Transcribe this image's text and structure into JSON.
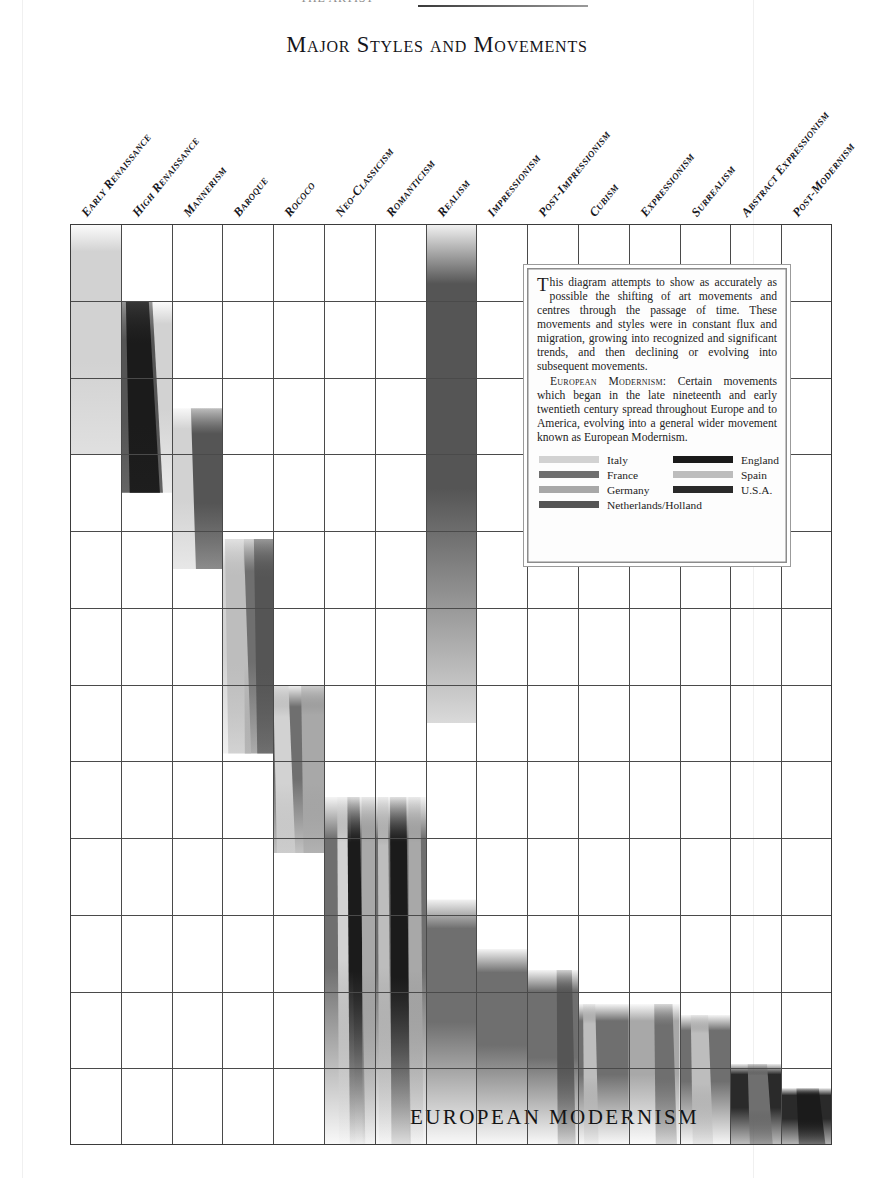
{
  "header": {
    "cropped_top_text": "THE ARTIST",
    "title": "Major Styles and Movements"
  },
  "axis": {
    "y_ticks": [
      "1400",
      "1450",
      "1500",
      "1550",
      "1600",
      "1650",
      "1700",
      "1750",
      "1800",
      "1850",
      "1900",
      "1950",
      "2000"
    ],
    "y_min": 1400,
    "y_max": 2000,
    "x_labels": [
      "Early Renaissance",
      "High Renaissance",
      "Mannerism",
      "Baroque",
      "Rococo",
      "Neo-Classicism",
      "Romanticism",
      "Realism",
      "Impressionism",
      "Post-Impressionism",
      "Cubism",
      "Expressionism",
      "Surrealism",
      "Abstract Expressionism",
      "Post-Modernism"
    ]
  },
  "overlay_band_label": "EUROPEAN MODERNISM",
  "infobox": {
    "paragraph1_dropcap": "T",
    "paragraph1": "his diagram attempts to show as accurately as possible the shifting of art movements and centres through the passage of time. These movements and styles were in constant flux and migration, growing into recognized and significant trends, and then declining or evolving into subsequent movements.",
    "paragraph2_lead": "European Modernism:",
    "paragraph2": " Certain movements which began in the late nineteenth and early twentieth century spread throughout Europe and to America, evolving into a general wider movement known as European Modernism.",
    "legend": {
      "column_a": [
        {
          "label": "Italy",
          "color": "#d2d2d2"
        },
        {
          "label": "France",
          "color": "#6f6f6f"
        },
        {
          "label": "Germany",
          "color": "#a8a8a8"
        }
      ],
      "column_b": [
        {
          "label": "England",
          "color": "#1b1b1b"
        },
        {
          "label": "Spain",
          "color": "#bdbdbd"
        },
        {
          "label": "U.S.A.",
          "color": "#2a2a2a"
        }
      ],
      "full_row": {
        "label": "Netherlands/Holland",
        "color": "#555555"
      }
    }
  },
  "chart_data": {
    "type": "bar",
    "title": "Major Styles and Movements",
    "xlabel": "",
    "ylabel": "Year",
    "ylim": [
      1400,
      2000
    ],
    "grid": true,
    "orientation": "vertical-timeline",
    "legend_position": "inside-box",
    "categories": [
      "Early Renaissance",
      "High Renaissance",
      "Mannerism",
      "Baroque",
      "Rococo",
      "Neo-Classicism",
      "Romanticism",
      "Realism",
      "Impressionism",
      "Post-Impressionism",
      "Cubism",
      "Expressionism",
      "Surrealism",
      "Abstract Expressionism",
      "Post-Modernism"
    ],
    "spans": [
      {
        "movement": "Early Renaissance",
        "col": 0,
        "start": 1400,
        "end": 1550,
        "countries": [
          "Italy"
        ]
      },
      {
        "movement": "High Renaissance",
        "col": 1,
        "start": 1450,
        "end": 1575,
        "countries": [
          "Italy",
          "Netherlands/Holland",
          "England"
        ]
      },
      {
        "movement": "Mannerism",
        "col": 2,
        "start": 1520,
        "end": 1625,
        "countries": [
          "Italy",
          "Netherlands/Holland"
        ]
      },
      {
        "movement": "Baroque",
        "col": 3,
        "start": 1605,
        "end": 1745,
        "countries": [
          "Italy",
          "France",
          "Netherlands/Holland",
          "Spain"
        ]
      },
      {
        "movement": "Rococo",
        "col": 4,
        "start": 1700,
        "end": 1810,
        "countries": [
          "France",
          "Italy",
          "Germany"
        ]
      },
      {
        "movement": "Neo-Classicism",
        "col": 5,
        "start": 1773,
        "end": 2000,
        "countries": [
          "France",
          "Italy",
          "England",
          "Germany"
        ]
      },
      {
        "movement": "Romanticism",
        "col": 6,
        "start": 1773,
        "end": 2000,
        "countries": [
          "France",
          "England",
          "Germany",
          "Spain"
        ]
      },
      {
        "movement": "Realism",
        "col": 7,
        "start": 1400,
        "end": 1725,
        "countries": [
          "Netherlands/Holland",
          "Italy"
        ]
      },
      {
        "movement": "Realism (modern)",
        "col": 7,
        "start": 1840,
        "end": 2000,
        "countries": [
          "France"
        ]
      },
      {
        "movement": "Impressionism",
        "col": 8,
        "start": 1872,
        "end": 2000,
        "countries": [
          "France"
        ]
      },
      {
        "movement": "Post-Impressionism",
        "col": 9,
        "start": 1886,
        "end": 2000,
        "countries": [
          "France",
          "Netherlands/Holland"
        ]
      },
      {
        "movement": "Cubism",
        "col": 10,
        "start": 1908,
        "end": 2000,
        "countries": [
          "France",
          "Spain"
        ]
      },
      {
        "movement": "Expressionism",
        "col": 11,
        "start": 1908,
        "end": 2000,
        "countries": [
          "Germany",
          "France"
        ]
      },
      {
        "movement": "Surrealism",
        "col": 12,
        "start": 1915,
        "end": 2000,
        "countries": [
          "France",
          "Spain"
        ]
      },
      {
        "movement": "Abstract Expressionism",
        "col": 13,
        "start": 1947,
        "end": 2000,
        "countries": [
          "U.S.A.",
          "France"
        ]
      },
      {
        "movement": "Post-Modernism",
        "col": 14,
        "start": 1963,
        "end": 2000,
        "countries": [
          "U.S.A.",
          "England"
        ]
      }
    ]
  },
  "colors": {
    "italy": "#d2d2d2",
    "france": "#6f6f6f",
    "germany": "#a8a8a8",
    "netherlands": "#555555",
    "england": "#1b1b1b",
    "spain": "#bdbdbd",
    "usa": "#2a2a2a",
    "grid": "#4a4a4a",
    "ink": "#15151b"
  }
}
